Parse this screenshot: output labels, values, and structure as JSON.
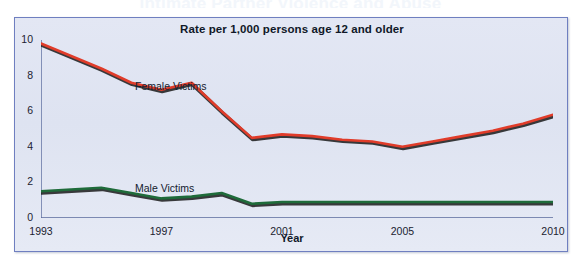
{
  "page": {
    "cut_off_heading": "Intimate Partner Violence and Abuse"
  },
  "chart_frame": {
    "title": "Rate per 1,000 persons age 12 and older",
    "x_axis_title": "Year",
    "series_labels": {
      "female": "Female Victims",
      "male": "Male Victims"
    }
  },
  "colors": {
    "panel_background": "#dfe4f2",
    "panel_border": "#6f7fc0",
    "female_line": "#e03c2a",
    "male_line": "#1f6b3a",
    "line_shadow": "#1a1a1a",
    "axis": "#5a6a9c",
    "text": "#101828"
  },
  "chart_data": {
    "type": "line",
    "title": "Rate per 1,000 persons age 12 and older",
    "xlabel": "Year",
    "ylabel": "",
    "xlim": [
      1993,
      2010
    ],
    "ylim": [
      0,
      10
    ],
    "yticks": [
      0,
      2,
      4,
      6,
      8,
      10
    ],
    "ytick_labels": [
      "0",
      "2",
      "4",
      "6",
      "8",
      "10"
    ],
    "xticks": [
      1993,
      1994,
      1995,
      1996,
      1997,
      1998,
      1999,
      2000,
      2001,
      2002,
      2003,
      2004,
      2005,
      2006,
      2007,
      2008,
      2009,
      2010
    ],
    "xtick_labels_shown": [
      "1993",
      "1997",
      "2001",
      "2005",
      "2010"
    ],
    "xtick_labels_shown_at": [
      1993,
      1997,
      2001,
      2005,
      2010
    ],
    "grid": false,
    "legend": "inline-annotations",
    "x": [
      1993,
      1994,
      1995,
      1996,
      1997,
      1998,
      1999,
      2000,
      2001,
      2002,
      2003,
      2004,
      2005,
      2006,
      2007,
      2008,
      2009,
      2010
    ],
    "series": [
      {
        "name": "Female Victims",
        "color": "#e03c2a",
        "values": [
          9.8,
          9.1,
          8.4,
          7.6,
          7.2,
          7.6,
          6.0,
          4.5,
          4.7,
          4.6,
          4.4,
          4.3,
          4.0,
          4.3,
          4.6,
          4.9,
          5.3,
          5.8
        ]
      },
      {
        "name": "Male Victims",
        "color": "#1f6b3a",
        "values": [
          1.5,
          1.6,
          1.7,
          1.4,
          1.1,
          1.2,
          1.4,
          0.8,
          0.9,
          0.9,
          0.9,
          0.9,
          0.9,
          0.9,
          0.9,
          0.9,
          0.9,
          0.9
        ]
      }
    ],
    "annotations": [
      {
        "text": "Female Victims",
        "x": 1996.5,
        "y": 8.2
      },
      {
        "text": "Male Victims",
        "x": 1996.5,
        "y": 2.3
      }
    ]
  }
}
